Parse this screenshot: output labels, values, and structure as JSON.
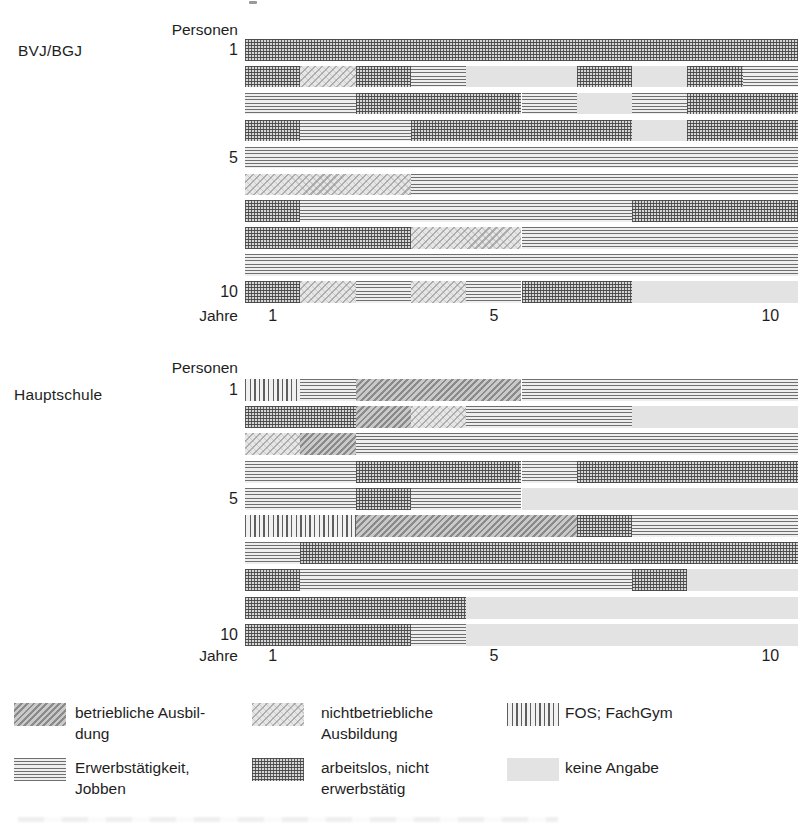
{
  "figure": {
    "background": "#ffffff",
    "text_color": "#1e1e1e"
  },
  "states": {
    "betrieblich": {
      "label": "betriebliche Ausbildung",
      "pattern": "dark diagonal hatch",
      "line_color": "#8a8a8a",
      "base_color": "#c9c9c9"
    },
    "nichtbetrieblich": {
      "label": "nichtbetriebliche Ausbildung",
      "pattern": "light diagonal hatch",
      "line_color": "#aeaeae",
      "base_color": "#e6e6e6"
    },
    "fos": {
      "label": "FOS; FachGym",
      "pattern": "vertical lines",
      "line_color": "#5e5e5e",
      "base_color": "#f1f1f1"
    },
    "erwerb": {
      "label": "Erwerbstätigkeit, Jobben",
      "pattern": "horizontal lines",
      "line_color": "#6f6f6f",
      "base_color": "#eeeeee"
    },
    "arbeitslos": {
      "label": "arbeitslos, nicht erwerbstätig",
      "pattern": "crosshatch grid",
      "line_color": "#4f4f4f",
      "base_color": "#d6d6d6"
    },
    "keine": {
      "label": "keine Angabe",
      "pattern": "plain light gray",
      "fill_color": "#e3e3e3"
    }
  },
  "legend": {
    "items": [
      {
        "key": "betrieblich",
        "lines": "betriebliche Ausbil-\ndung"
      },
      {
        "key": "nichtbetrieblich",
        "lines": "nichtbetriebliche\nAusbildung"
      },
      {
        "key": "fos",
        "lines": "FOS; FachGym"
      },
      {
        "key": "erwerb",
        "lines": "Erwerbstätigkeit,\nJobben"
      },
      {
        "key": "arbeitslos",
        "lines": "arbeitslos, nicht\nerwerbstätig"
      },
      {
        "key": "keine",
        "lines": "keine Angabe"
      }
    ]
  },
  "chart_data": [
    {
      "type": "bar",
      "subtype": "horizontal-stacked-sequence-timeline",
      "group_label": "BVJ/BGJ",
      "y_axis_title": "Personen",
      "x_axis_title": "Jahre",
      "x_ticks": [
        1,
        5,
        10
      ],
      "x_range_years": [
        0,
        10
      ],
      "grid": false,
      "persons": [
        {
          "label": "1",
          "segments": [
            {
              "from": 0,
              "to": 10,
              "state": "arbeitslos"
            }
          ]
        },
        {
          "label": "",
          "segments": [
            {
              "from": 0,
              "to": 1,
              "state": "arbeitslos"
            },
            {
              "from": 1,
              "to": 2,
              "state": "nichtbetrieblich"
            },
            {
              "from": 2,
              "to": 3,
              "state": "arbeitslos"
            },
            {
              "from": 3,
              "to": 4,
              "state": "erwerb"
            },
            {
              "from": 4,
              "to": 6,
              "state": "keine"
            },
            {
              "from": 6,
              "to": 7,
              "state": "arbeitslos"
            },
            {
              "from": 7,
              "to": 8,
              "state": "keine"
            },
            {
              "from": 8,
              "to": 9,
              "state": "arbeitslos"
            },
            {
              "from": 9,
              "to": 10,
              "state": "erwerb"
            }
          ]
        },
        {
          "label": "",
          "segments": [
            {
              "from": 0,
              "to": 2,
              "state": "erwerb"
            },
            {
              "from": 2,
              "to": 5,
              "state": "arbeitslos"
            },
            {
              "from": 5,
              "to": 6,
              "state": "erwerb"
            },
            {
              "from": 6,
              "to": 7,
              "state": "keine"
            },
            {
              "from": 7,
              "to": 8,
              "state": "erwerb"
            },
            {
              "from": 8,
              "to": 10,
              "state": "arbeitslos"
            }
          ]
        },
        {
          "label": "",
          "segments": [
            {
              "from": 0,
              "to": 1,
              "state": "arbeitslos"
            },
            {
              "from": 1,
              "to": 3,
              "state": "erwerb"
            },
            {
              "from": 3,
              "to": 7,
              "state": "arbeitslos"
            },
            {
              "from": 7,
              "to": 8,
              "state": "keine"
            },
            {
              "from": 8,
              "to": 10,
              "state": "arbeitslos"
            }
          ]
        },
        {
          "label": "5",
          "segments": [
            {
              "from": 0,
              "to": 10,
              "state": "erwerb"
            }
          ]
        },
        {
          "label": "",
          "segments": [
            {
              "from": 0,
              "to": 3,
              "state": "nichtbetrieblich"
            },
            {
              "from": 3,
              "to": 10,
              "state": "erwerb"
            }
          ]
        },
        {
          "label": "",
          "segments": [
            {
              "from": 0,
              "to": 1,
              "state": "arbeitslos"
            },
            {
              "from": 1,
              "to": 7,
              "state": "erwerb"
            },
            {
              "from": 7,
              "to": 10,
              "state": "arbeitslos"
            }
          ]
        },
        {
          "label": "",
          "segments": [
            {
              "from": 0,
              "to": 3,
              "state": "arbeitslos"
            },
            {
              "from": 3,
              "to": 5,
              "state": "nichtbetrieblich"
            },
            {
              "from": 5,
              "to": 10,
              "state": "erwerb"
            }
          ]
        },
        {
          "label": "",
          "segments": [
            {
              "from": 0,
              "to": 10,
              "state": "erwerb"
            }
          ]
        },
        {
          "label": "10",
          "segments": [
            {
              "from": 0,
              "to": 1,
              "state": "arbeitslos"
            },
            {
              "from": 1,
              "to": 2,
              "state": "nichtbetrieblich"
            },
            {
              "from": 2,
              "to": 3,
              "state": "erwerb"
            },
            {
              "from": 3,
              "to": 4,
              "state": "nichtbetrieblich"
            },
            {
              "from": 4,
              "to": 5,
              "state": "erwerb"
            },
            {
              "from": 5,
              "to": 7,
              "state": "arbeitslos"
            },
            {
              "from": 7,
              "to": 10,
              "state": "keine"
            }
          ]
        }
      ]
    },
    {
      "type": "bar",
      "subtype": "horizontal-stacked-sequence-timeline",
      "group_label": "Hauptschule",
      "y_axis_title": "Personen",
      "x_axis_title": "Jahre",
      "x_ticks": [
        1,
        5,
        10
      ],
      "x_range_years": [
        0,
        10
      ],
      "grid": false,
      "persons": [
        {
          "label": "1",
          "segments": [
            {
              "from": 0,
              "to": 1,
              "state": "fos"
            },
            {
              "from": 1,
              "to": 2,
              "state": "erwerb"
            },
            {
              "from": 2,
              "to": 5,
              "state": "betrieblich"
            },
            {
              "from": 5,
              "to": 10,
              "state": "erwerb"
            }
          ]
        },
        {
          "label": "",
          "segments": [
            {
              "from": 0,
              "to": 2,
              "state": "arbeitslos"
            },
            {
              "from": 2,
              "to": 3,
              "state": "betrieblich"
            },
            {
              "from": 3,
              "to": 4,
              "state": "nichtbetrieblich"
            },
            {
              "from": 4,
              "to": 7,
              "state": "erwerb"
            },
            {
              "from": 7,
              "to": 10,
              "state": "keine"
            }
          ]
        },
        {
          "label": "",
          "segments": [
            {
              "from": 0,
              "to": 1,
              "state": "nichtbetrieblich"
            },
            {
              "from": 1,
              "to": 2,
              "state": "betrieblich"
            },
            {
              "from": 2,
              "to": 10,
              "state": "erwerb"
            }
          ]
        },
        {
          "label": "",
          "segments": [
            {
              "from": 0,
              "to": 2,
              "state": "erwerb"
            },
            {
              "from": 2,
              "to": 5,
              "state": "arbeitslos"
            },
            {
              "from": 5,
              "to": 6,
              "state": "erwerb"
            },
            {
              "from": 6,
              "to": 10,
              "state": "arbeitslos"
            }
          ]
        },
        {
          "label": "5",
          "segments": [
            {
              "from": 0,
              "to": 2,
              "state": "erwerb"
            },
            {
              "from": 2,
              "to": 3,
              "state": "arbeitslos"
            },
            {
              "from": 3,
              "to": 5,
              "state": "erwerb"
            },
            {
              "from": 5,
              "to": 10,
              "state": "keine"
            }
          ]
        },
        {
          "label": "",
          "segments": [
            {
              "from": 0,
              "to": 2,
              "state": "fos"
            },
            {
              "from": 2,
              "to": 6,
              "state": "betrieblich"
            },
            {
              "from": 6,
              "to": 7,
              "state": "arbeitslos"
            },
            {
              "from": 7,
              "to": 10,
              "state": "erwerb"
            }
          ]
        },
        {
          "label": "",
          "segments": [
            {
              "from": 0,
              "to": 1,
              "state": "erwerb"
            },
            {
              "from": 1,
              "to": 10,
              "state": "arbeitslos"
            }
          ]
        },
        {
          "label": "",
          "segments": [
            {
              "from": 0,
              "to": 1,
              "state": "arbeitslos"
            },
            {
              "from": 1,
              "to": 7,
              "state": "erwerb"
            },
            {
              "from": 7,
              "to": 8,
              "state": "arbeitslos"
            },
            {
              "from": 8,
              "to": 10,
              "state": "keine"
            }
          ]
        },
        {
          "label": "",
          "segments": [
            {
              "from": 0,
              "to": 4,
              "state": "arbeitslos"
            },
            {
              "from": 4,
              "to": 10,
              "state": "keine"
            }
          ]
        },
        {
          "label": "10",
          "segments": [
            {
              "from": 0,
              "to": 3,
              "state": "arbeitslos"
            },
            {
              "from": 3,
              "to": 4,
              "state": "erwerb"
            },
            {
              "from": 4,
              "to": 10,
              "state": "keine"
            }
          ]
        }
      ]
    }
  ]
}
